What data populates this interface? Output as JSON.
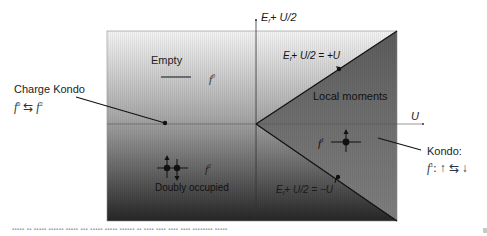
{
  "diagram": {
    "type": "phase-diagram",
    "axes": {
      "y_label": {
        "E": "E",
        "sub": "f",
        "rest": "+ U/2"
      },
      "x_label": "U"
    },
    "regions": {
      "empty": {
        "label": "Empty",
        "state": "f",
        "state_sup": "0"
      },
      "local_moments": {
        "label": "Local moments",
        "state": "f",
        "state_sup": "1"
      },
      "doubly_occupied": {
        "label": "Doubly occupied",
        "state": "f",
        "state_sup": "2"
      }
    },
    "boundaries": {
      "upper": {
        "E": "E",
        "sub": "f",
        "rest": "+ U/2 = +U"
      },
      "lower": {
        "E": "E",
        "sub": "f",
        "rest": "+ U/2 = −U"
      }
    },
    "callouts": {
      "charge_kondo": {
        "title": "Charge Kondo",
        "formula_left": "f",
        "formula_left_sup": "0",
        "exchange": "⇆",
        "formula_right": "f",
        "formula_right_sup": "2"
      },
      "kondo": {
        "title": "Kondo:",
        "formula_state": "f",
        "formula_state_sup": "1",
        "formula_rest": ": ↑ ⇆ ↓"
      }
    },
    "colors": {
      "gradient_top": "#f2f2f2",
      "gradient_mid": "#9a9a9a",
      "gradient_bottom": "#2a2a2a",
      "wedge_top": "#6a6a6a",
      "wedge_bottom": "#7a7a7a",
      "line": "#111111"
    }
  },
  "caption": "Phase diagram of the Anderson impurity model in the particle-hole plane (blurred caption text)"
}
